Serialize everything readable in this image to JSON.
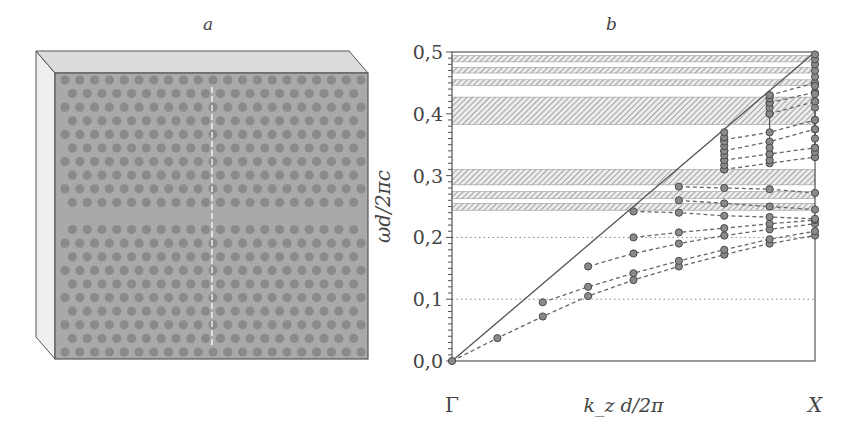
{
  "panel_a": {
    "label": "a",
    "description": "3D slab photonic crystal with hexagonal lattice of holes and a line-defect waveguide (missing row)",
    "colors": {
      "front": "#a9a9a9",
      "top": "#dcdcdc",
      "side": "#efefef",
      "hole": "#8a8a8a",
      "edge": "#555555"
    },
    "rows_above_defect": 10,
    "rows_below_defect": 10,
    "holes_per_row": 21
  },
  "panel_b": {
    "label": "b",
    "xlabel": "k_z d/2π",
    "ylabel": "ωd/2πc",
    "x_tick_labels": [
      "Γ",
      "X"
    ]
  },
  "chart_data": {
    "type": "scatter",
    "title": "b",
    "xlabel": "k_z d/2π",
    "ylabel": "ωd/2πc",
    "xlim": [
      0,
      0.5
    ],
    "ylim": [
      0,
      0.5
    ],
    "x_tick_labels": [
      {
        "x": 0,
        "label": "Γ"
      },
      {
        "x": 0.5,
        "label": "X"
      }
    ],
    "y_ticks": [
      0.0,
      0.1,
      0.2,
      0.3,
      0.4,
      0.5
    ],
    "y_tick_labels": [
      "0,0",
      "0,1",
      "0,2",
      "0,3",
      "0,4",
      "0,5"
    ],
    "y_minor_step": 0.01,
    "dotted_gridlines_y": [
      0.1,
      0.2
    ],
    "light_line": {
      "from": [
        0,
        0
      ],
      "to": [
        0.5,
        0.5
      ],
      "style": "solid"
    },
    "hatched_bands": [
      [
        0.484,
        0.494
      ],
      [
        0.466,
        0.475
      ],
      [
        0.446,
        0.455
      ],
      [
        0.383,
        0.427
      ],
      [
        0.285,
        0.31
      ],
      [
        0.263,
        0.274
      ],
      [
        0.244,
        0.255
      ]
    ],
    "k_columns": [
      0,
      0.0625,
      0.125,
      0.1875,
      0.25,
      0.3125,
      0.375,
      0.4375,
      0.5
    ],
    "series": [
      {
        "name": "mode 1",
        "k": [
          0,
          0.0625,
          0.125,
          0.1875,
          0.25,
          0.3125,
          0.375,
          0.4375,
          0.5
        ],
        "omega": [
          0,
          0.037,
          0.072,
          0.105,
          0.131,
          0.153,
          0.172,
          0.19,
          0.203
        ]
      },
      {
        "name": "mode 2",
        "k": [
          0.125,
          0.1875,
          0.25,
          0.3125,
          0.375,
          0.4375,
          0.5
        ],
        "omega": [
          0.095,
          0.12,
          0.142,
          0.162,
          0.18,
          0.197,
          0.21
        ]
      },
      {
        "name": "mode 3",
        "k": [
          0.1875,
          0.25,
          0.3125,
          0.375,
          0.4375,
          0.5
        ],
        "omega": [
          0.153,
          0.174,
          0.19,
          0.203,
          0.213,
          0.222
        ]
      },
      {
        "name": "mode 4",
        "k": [
          0.25,
          0.3125,
          0.375,
          0.4375,
          0.5
        ],
        "omega": [
          0.2,
          0.208,
          0.215,
          0.222,
          0.228
        ]
      },
      {
        "name": "mode 5",
        "k": [
          0.25,
          0.3125,
          0.375,
          0.4375,
          0.5
        ],
        "omega": [
          0.242,
          0.24,
          0.235,
          0.233,
          0.23
        ]
      },
      {
        "name": "mode 6",
        "k": [
          0.3125,
          0.375,
          0.4375,
          0.5
        ],
        "omega": [
          0.26,
          0.255,
          0.25,
          0.245
        ]
      },
      {
        "name": "mode 7",
        "k": [
          0.3125,
          0.375,
          0.4375,
          0.5
        ],
        "omega": [
          0.282,
          0.28,
          0.278,
          0.272
        ]
      },
      {
        "name": "mode 8",
        "k": [
          0.375,
          0.4375,
          0.5
        ],
        "omega": [
          0.31,
          0.32,
          0.33
        ]
      },
      {
        "name": "mode 9",
        "k": [
          0.375,
          0.4375,
          0.5
        ],
        "omega": [
          0.325,
          0.335,
          0.345
        ]
      },
      {
        "name": "mode 10",
        "k": [
          0.375,
          0.4375,
          0.5
        ],
        "omega": [
          0.34,
          0.355,
          0.375
        ]
      },
      {
        "name": "mode 11",
        "k": [
          0.375,
          0.4375,
          0.5
        ],
        "omega": [
          0.358,
          0.37,
          0.39
        ]
      },
      {
        "name": "mode 12",
        "k": [
          0.4375,
          0.5
        ],
        "omega": [
          0.4,
          0.42
        ]
      },
      {
        "name": "mode 13",
        "k": [
          0.4375,
          0.5
        ],
        "omega": [
          0.418,
          0.435
        ]
      },
      {
        "name": "mode 14",
        "k": [
          0.4375,
          0.5
        ],
        "omega": [
          0.43,
          0.45
        ]
      }
    ],
    "column_stacks": [
      {
        "k": 0.375,
        "omega": [
          0.31,
          0.317,
          0.325,
          0.333,
          0.34,
          0.348,
          0.355,
          0.362,
          0.37
        ]
      },
      {
        "k": 0.4375,
        "omega": [
          0.325,
          0.335,
          0.345,
          0.4,
          0.41,
          0.418,
          0.425,
          0.43
        ]
      },
      {
        "k": 0.5,
        "omega": [
          0.33,
          0.338,
          0.345,
          0.36,
          0.375,
          0.39,
          0.41,
          0.42,
          0.432,
          0.445,
          0.46,
          0.47,
          0.48,
          0.488,
          0.496
        ]
      }
    ],
    "grid": false,
    "legend": null
  }
}
